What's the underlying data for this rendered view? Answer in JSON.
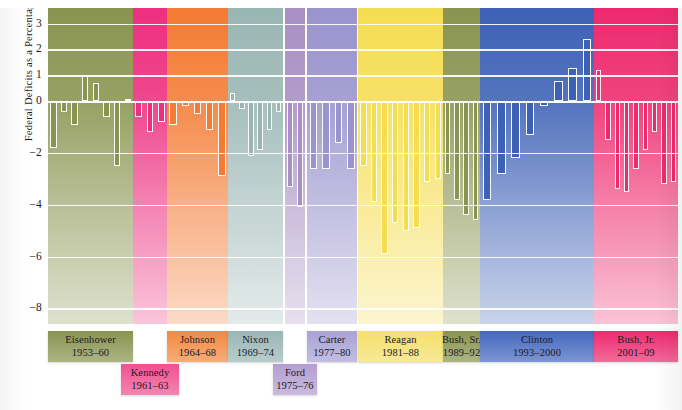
{
  "chart_data": {
    "type": "bar",
    "title": "",
    "xlabel": "",
    "ylabel": "Federal Deficits as a Percentage of GDP",
    "ylim": [
      -8.6,
      3.6
    ],
    "yticks": [
      3,
      2,
      1,
      0,
      -2,
      -4,
      -6,
      -8
    ],
    "ytick_labels": [
      "3",
      "2",
      "1",
      "0",
      "−2",
      "−4",
      "−6",
      "−8"
    ],
    "grid": true,
    "legend": "none",
    "note": "Bars are annual federal surplus (positive) / deficit (negative) as a percent of GDP, grouped by presidential administration.",
    "groups": [
      {
        "name": "Eisenhower",
        "years": "1953–60",
        "color": "#8a9450",
        "label_color": "#8a9450",
        "x0": 0,
        "x1": 85,
        "values": [
          -1.8,
          -0.4,
          -0.9,
          1.0,
          0.7,
          -0.6,
          -2.5,
          0.1
        ]
      },
      {
        "name": "Kennedy",
        "years": "1961–63",
        "color": "#ed2f7f",
        "label_color": "#f0518f",
        "x0": 85,
        "x1": 119,
        "values": [
          -0.6,
          -1.2,
          -0.8
        ]
      },
      {
        "name": "Johnson",
        "years": "1964–68",
        "color": "#f47b33",
        "label_color": "#f4893f",
        "x0": 119,
        "x1": 180,
        "values": [
          -0.9,
          -0.2,
          -0.5,
          -1.1,
          -2.9
        ]
      },
      {
        "name": "Nixon",
        "years": "1969–74",
        "color": "#9ab6b4",
        "label_color": "#9ab6b4",
        "x0": 180,
        "x1": 235,
        "values": [
          0.3,
          -0.3,
          -2.1,
          -1.9,
          -1.1,
          -0.4
        ]
      },
      {
        "name": "Ford",
        "years": "1975–76",
        "color": "#a88fc4",
        "label_color": "#b49ed0",
        "x0": 237,
        "x1": 257,
        "values": [
          -3.3,
          -4.1
        ]
      },
      {
        "name": "Carter",
        "years": "1977–80",
        "color": "#9a93cd",
        "label_color": "#a8a2d6",
        "x0": 259,
        "x1": 309,
        "values": [
          -2.6,
          -2.6,
          -1.6,
          -2.6
        ]
      },
      {
        "name": "Reagan",
        "years": "1981–88",
        "color": "#f5dd52",
        "label_color": "#f5e06a",
        "x0": 310,
        "x1": 395,
        "values": [
          -2.5,
          -3.9,
          -5.9,
          -4.7,
          -5.0,
          -4.9,
          -3.1,
          -3.0
        ]
      },
      {
        "name": "Bush, Sr.",
        "years": "1989–92",
        "color": "#8a9450",
        "label_color": "#8a9450",
        "x0": 395,
        "x1": 432,
        "values": [
          -2.8,
          -3.8,
          -4.4,
          -4.6
        ]
      },
      {
        "name": "Clinton",
        "years": "1993–2000",
        "color": "#3d61b5",
        "label_color": "#4568be",
        "x0": 432,
        "x1": 546,
        "values": [
          -3.8,
          -2.8,
          -2.2,
          -1.3,
          -0.2,
          0.8,
          1.3,
          2.4
        ]
      },
      {
        "name": "Bush, Jr.",
        "years": "2001–09",
        "color": "#ee2a6e",
        "label_color": "#ee2a6e",
        "x0": 546,
        "x1": 630,
        "values": [
          1.2,
          -1.5,
          -3.4,
          -3.5,
          -2.6,
          -1.9,
          -1.2,
          -3.2,
          -3.1
        ]
      }
    ]
  }
}
